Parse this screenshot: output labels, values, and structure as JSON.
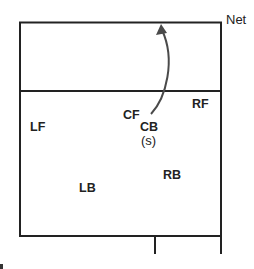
{
  "diagram": {
    "net_label": "Net",
    "players": {
      "lf": "LF",
      "cf": "CF",
      "rf": "RF",
      "cb": "CB",
      "cb_sub": "(s)",
      "lb": "LB",
      "rb": "RB"
    },
    "colors": {
      "line": "#222222",
      "arrow": "#4a4a4a",
      "background": "#ffffff"
    }
  }
}
